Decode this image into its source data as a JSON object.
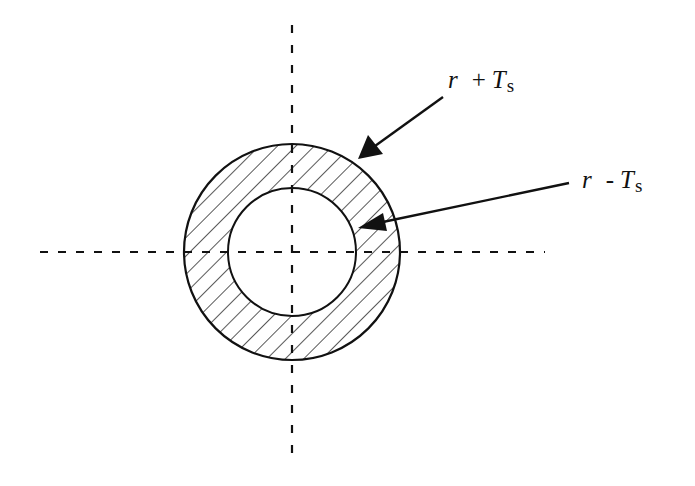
{
  "figure": {
    "colors": {
      "stroke": "#111111",
      "background": "#ffffff"
    },
    "geometry": {
      "center": [
        292,
        252
      ],
      "outer_radius": 108,
      "inner_radius": 64,
      "hatch_direction": "diagonal (top-left to bottom-right)"
    },
    "centerlines": {
      "horizontal": {
        "x1": 40,
        "x2": 545,
        "y": 252,
        "style": "dashed"
      },
      "vertical": {
        "x": 292,
        "y1": 25,
        "y2": 455,
        "style": "dashed"
      }
    },
    "labels": {
      "outer": {
        "variable": "r",
        "operator": "+",
        "term": "T",
        "subscript": "s",
        "points_to": "outer circle"
      },
      "inner": {
        "variable": "r",
        "operator": "-",
        "term": "T",
        "subscript": "s",
        "points_to": "inner circle"
      }
    }
  }
}
